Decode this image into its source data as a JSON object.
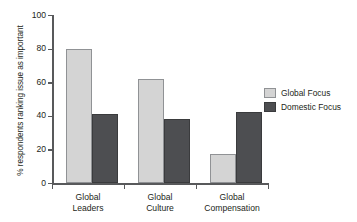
{
  "chart_data": {
    "type": "bar",
    "title": "",
    "subtitle": "",
    "xlabel": "",
    "ylabel": "% respondents ranking issue as important",
    "ylim": [
      0,
      100
    ],
    "yticks": [
      0,
      20,
      40,
      60,
      80,
      100
    ],
    "ytick_labels": [
      "0",
      "20",
      "40",
      "60",
      "80",
      "100"
    ],
    "grid": false,
    "legend_position": "right",
    "categories": [
      "Global Leaders",
      "Global Culture",
      "Global Compensation"
    ],
    "category_lines": [
      {
        "line1": "Global",
        "line2": "Leaders"
      },
      {
        "line1": "Global",
        "line2": "Culture"
      },
      {
        "line1": "Global",
        "line2": "Compensation"
      }
    ],
    "series": [
      {
        "name": "Global Focus",
        "color": "#d4d4d4",
        "values": [
          80,
          62,
          17
        ]
      },
      {
        "name": "Domestic Focus",
        "color": "#4d4e51",
        "values": [
          41,
          38,
          42
        ]
      }
    ]
  },
  "legend": {
    "items": [
      {
        "label": "Global Focus"
      },
      {
        "label": "Domestic Focus"
      }
    ]
  },
  "colors": {
    "global_focus": "#d4d4d4",
    "domestic_focus": "#4d4e51",
    "axis": "#58595b",
    "text": "#231f20",
    "background": "#ffffff"
  }
}
